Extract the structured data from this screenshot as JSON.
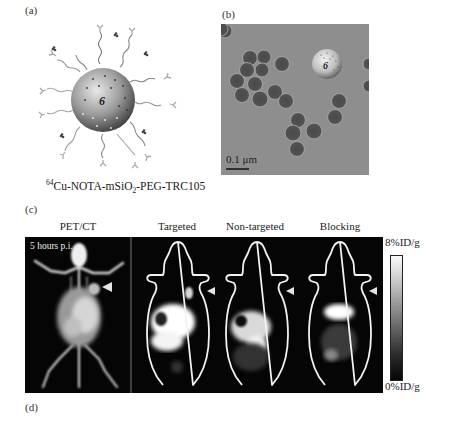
{
  "figure": {
    "panel_a": {
      "label": "(a)",
      "sphere_glyph": "6",
      "caption": {
        "superscript": "64",
        "part1": "Cu-NOTA-mSiO",
        "subscript": "2",
        "part2": "-PEG-TRC105"
      }
    },
    "panel_b": {
      "label": "(b)",
      "sphere_glyph": "6",
      "scale_bar_label": "0.1 μm"
    },
    "panel_c": {
      "label": "(c)",
      "columns": [
        {
          "label": "PET/CT",
          "overlay_text": "5 hours p.i."
        },
        {
          "label": "Targeted"
        },
        {
          "label": "Non-targeted"
        },
        {
          "label": "Blocking"
        }
      ],
      "colorbar": {
        "max_label": "8%ID/g",
        "min_label": "0%ID/g"
      }
    },
    "panel_d": {
      "label": "(d)"
    }
  }
}
